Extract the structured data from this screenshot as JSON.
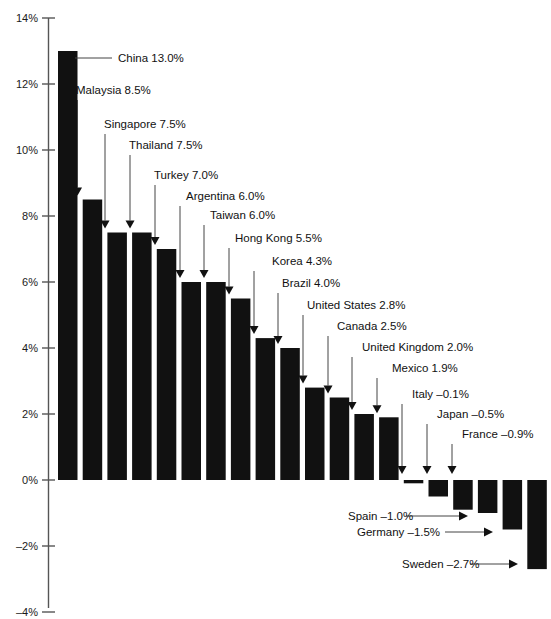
{
  "chart_data": {
    "type": "bar",
    "title": "",
    "subtitle": "",
    "xlabel": "",
    "ylabel": "",
    "ylim": [
      -4,
      14
    ],
    "yticks": [
      14,
      12,
      10,
      8,
      6,
      4,
      2,
      0,
      -2,
      -4
    ],
    "ytick_labels": [
      "14%",
      "12%",
      "10%",
      "8%",
      "6%",
      "4%",
      "2%",
      "0%",
      "-2%",
      "-4%"
    ],
    "grid": false,
    "legend": "none",
    "bar_color": "#111111",
    "categories": [
      "China",
      "Malaysia",
      "Singapore",
      "Thailand",
      "Turkey",
      "Argentina",
      "Taiwan",
      "Hong Kong",
      "Korea",
      "Brazil",
      "United States",
      "Canada",
      "United Kingdom",
      "Mexico",
      "Italy",
      "Japan",
      "France",
      "Spain",
      "Germany",
      "Sweden"
    ],
    "values": [
      13.0,
      8.5,
      7.5,
      7.5,
      7.0,
      6.0,
      6.0,
      5.5,
      4.3,
      4.0,
      2.8,
      2.5,
      2.0,
      1.9,
      -0.1,
      -0.5,
      -0.9,
      -1.0,
      -1.5,
      -2.7
    ],
    "annotations": [
      {
        "text": "China 13.0%",
        "country": "China",
        "value": "13.0%"
      },
      {
        "text": "Malaysia 8.5%",
        "country": "Malaysia",
        "value": "8.5%"
      },
      {
        "text": "Singapore 7.5%",
        "country": "Singapore",
        "value": "7.5%"
      },
      {
        "text": "Thailand 7.5%",
        "country": "Thailand",
        "value": "7.5%"
      },
      {
        "text": "Turkey 7.0%",
        "country": "Turkey",
        "value": "7.0%"
      },
      {
        "text": "Argentina 6.0%",
        "country": "Argentina",
        "value": "6.0%"
      },
      {
        "text": "Taiwan 6.0%",
        "country": "Taiwan",
        "value": "6.0%"
      },
      {
        "text": "Hong Kong 5.5%",
        "country": "Hong Kong",
        "value": "5.5%"
      },
      {
        "text": "Korea 4.3%",
        "country": "Korea",
        "value": "4.3%"
      },
      {
        "text": "Brazil 4.0%",
        "country": "Brazil",
        "value": "4.0%"
      },
      {
        "text": "United States 2.8%",
        "country": "United States",
        "value": "2.8%"
      },
      {
        "text": "Canada 2.5%",
        "country": "Canada",
        "value": "2.5%"
      },
      {
        "text": "United Kingdom 2.0%",
        "country": "United Kingdom",
        "value": "2.0%"
      },
      {
        "text": "Mexico 1.9%",
        "country": "Mexico",
        "value": "1.9%"
      },
      {
        "text": "Italy -0.1%",
        "country": "Italy",
        "value": "-0.1%"
      },
      {
        "text": "Japan -0.5%",
        "country": "Japan",
        "value": "-0.5%"
      },
      {
        "text": "France -0.9%",
        "country": "France",
        "value": "-0.9%"
      },
      {
        "text": "Spain -1.0%",
        "country": "Spain",
        "value": "-1.0%"
      },
      {
        "text": "Germany -1.5%",
        "country": "Germany",
        "value": "-1.5%"
      },
      {
        "text": "Sweden -2.7%",
        "country": "Sweden",
        "value": "-2.7%"
      }
    ]
  },
  "axis": {
    "ticks": [
      {
        "label": "14%",
        "value": 14
      },
      {
        "label": "12%",
        "value": 12
      },
      {
        "label": "10%",
        "value": 10
      },
      {
        "label": "8%",
        "value": 8
      },
      {
        "label": "6%",
        "value": 6
      },
      {
        "label": "4%",
        "value": 4
      },
      {
        "label": "2%",
        "value": 2
      },
      {
        "label": "0%",
        "value": 0
      },
      {
        "label": "-2%",
        "value": -2
      },
      {
        "label": "-4%",
        "value": -4
      }
    ]
  }
}
